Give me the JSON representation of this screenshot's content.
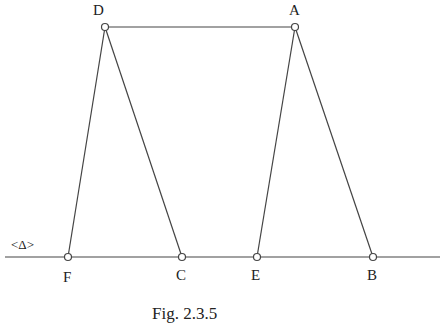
{
  "points": {
    "D": {
      "label": "D",
      "x": 105,
      "y": 27
    },
    "A": {
      "label": "A",
      "x": 295,
      "y": 27
    },
    "F": {
      "label": "F",
      "x": 68,
      "y": 257
    },
    "C": {
      "label": "C",
      "x": 182,
      "y": 257
    },
    "E": {
      "label": "E",
      "x": 257,
      "y": 257
    },
    "B": {
      "label": "B",
      "x": 373,
      "y": 257
    }
  },
  "line_label": "<Δ>",
  "caption": "Fig. 2.3.5",
  "segments": [
    [
      "D",
      "A"
    ],
    [
      "D",
      "F"
    ],
    [
      "D",
      "C"
    ],
    [
      "A",
      "E"
    ],
    [
      "A",
      "B"
    ]
  ]
}
